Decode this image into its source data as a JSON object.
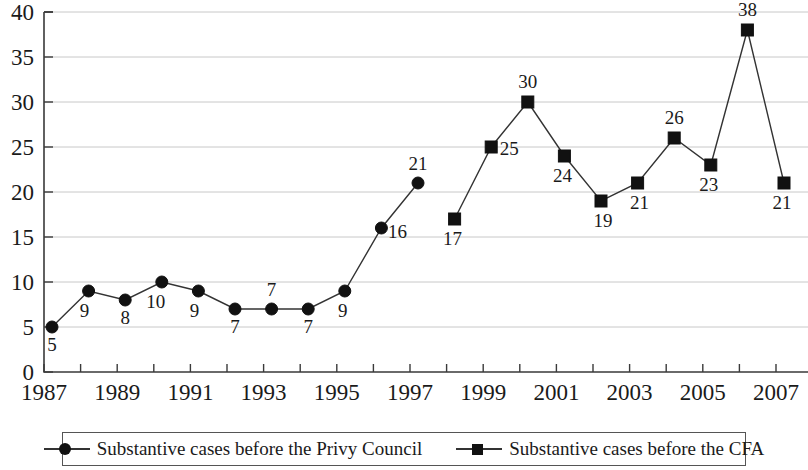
{
  "chart_data": {
    "type": "line",
    "title": "",
    "xlabel": "",
    "ylabel": "",
    "ylim": [
      0,
      40
    ],
    "xlim": [
      1987,
      2008
    ],
    "ytick_labels": [
      "0",
      "5",
      "10",
      "15",
      "20",
      "25",
      "30",
      "35",
      "40"
    ],
    "ytick_values": [
      0,
      5,
      10,
      15,
      20,
      25,
      30,
      35,
      40
    ],
    "xtick_labels": [
      "1987",
      "1989",
      "1991",
      "1993",
      "1995",
      "1997",
      "1999",
      "2001",
      "2003",
      "2005",
      "2007"
    ],
    "xtick_values": [
      1987,
      1989,
      1991,
      1993,
      1995,
      1997,
      1999,
      2001,
      2003,
      2005,
      2007
    ],
    "grid": "horizontal",
    "legend_position": "bottom",
    "series": [
      {
        "name": "Substantive cases before the Privy Council",
        "marker": "circle",
        "x": [
          1987,
          1988,
          1989,
          1990,
          1991,
          1992,
          1993,
          1994,
          1995,
          1996,
          1997
        ],
        "values": [
          5,
          9,
          8,
          10,
          9,
          7,
          7,
          7,
          9,
          16,
          21
        ],
        "labels": [
          "5",
          "9",
          "8",
          "10",
          "9",
          "7",
          "7",
          "7",
          "9",
          "16",
          "21"
        ]
      },
      {
        "name": "Substantive cases before the CFA",
        "marker": "square",
        "x": [
          1998,
          1999,
          2000,
          2001,
          2002,
          2003,
          2004,
          2005,
          2006,
          2007
        ],
        "values": [
          17,
          25,
          30,
          24,
          19,
          21,
          26,
          23,
          38,
          21
        ],
        "labels": [
          "17",
          "25",
          "30",
          "24",
          "19",
          "21",
          "26",
          "23",
          "38",
          "21"
        ]
      }
    ]
  },
  "legend": {
    "entries": [
      {
        "label": "Substantive cases before the Privy Council",
        "marker": "circle"
      },
      {
        "label": "Substantive cases before the CFA",
        "marker": "square"
      }
    ]
  }
}
